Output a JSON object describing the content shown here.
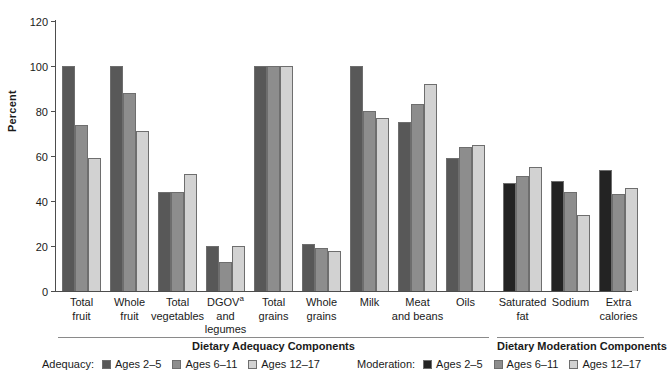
{
  "chart_data": {
    "type": "bar",
    "title": "",
    "xlabel": "",
    "ylabel": "Percent",
    "ylim": [
      0,
      120
    ],
    "ytick_values": [
      120,
      100,
      80,
      60,
      40,
      20,
      0
    ],
    "ytick_labels": [
      "120",
      "100",
      "80",
      "60",
      "40",
      "20",
      "0"
    ],
    "grid": false,
    "legend_position": "bottom",
    "categories": [
      "Total\nfruit",
      "Whole\nfruit",
      "Total\nvegetables",
      "DGOV\nand\nlegumes",
      "Total\ngrains",
      "Whole\ngrains",
      "Milk",
      "Meat\nand beans",
      "Oils",
      "Saturated\nfat",
      "Sodium",
      "Extra\ncalories"
    ],
    "series": [
      {
        "name": "Ages 2–5",
        "values": [
          100,
          100,
          44,
          20,
          100,
          21,
          100,
          75,
          59,
          48,
          49,
          54
        ]
      },
      {
        "name": "Ages 6–11",
        "values": [
          74,
          88,
          44,
          13,
          100,
          19,
          80,
          83,
          64,
          51,
          44,
          43
        ]
      },
      {
        "name": "Ages 12–17",
        "values": [
          59,
          71,
          52,
          20,
          100,
          18,
          77,
          92,
          65,
          55,
          34,
          46
        ]
      }
    ],
    "annotations": [
      "DGOVᵃ = dark green, orange vegetables"
    ],
    "sections": [
      {
        "name": "Dietary Adequacy Components",
        "categories": 9
      },
      {
        "name": "Dietary Moderation Components",
        "categories": 3
      }
    ]
  },
  "axis": {
    "y_title": "Percent",
    "y_ticks": [
      "120",
      "100",
      "80",
      "60",
      "40",
      "20",
      "0"
    ]
  },
  "categories": [
    {
      "line1": "Total",
      "line2": "fruit",
      "line3": ""
    },
    {
      "line1": "Whole",
      "line2": "fruit",
      "line3": ""
    },
    {
      "line1": "Total",
      "line2": "vegetables",
      "line3": ""
    },
    {
      "line1": "DGOV",
      "sup": "a",
      "line2": "and",
      "line3": "legumes"
    },
    {
      "line1": "Total",
      "line2": "grains",
      "line3": ""
    },
    {
      "line1": "Whole",
      "line2": "grains",
      "line3": ""
    },
    {
      "line1": "Milk",
      "line2": "",
      "line3": ""
    },
    {
      "line1": "Meat",
      "line2": "and beans",
      "line3": ""
    },
    {
      "line1": "Oils",
      "line2": "",
      "line3": ""
    },
    {
      "line1": "Saturated",
      "line2": "fat",
      "line3": ""
    },
    {
      "line1": "Sodium",
      "line2": "",
      "line3": ""
    },
    {
      "line1": "Extra",
      "line2": "calories",
      "line3": ""
    }
  ],
  "sections": {
    "adequacy_title": "Dietary Adequacy Components",
    "moderation_title": "Dietary Moderation Components"
  },
  "legend": {
    "adequacy_caption": "Adequacy:",
    "moderation_caption": "Moderation:",
    "entries": [
      "Ages 2–5",
      "Ages 6–11",
      "Ages 12–17"
    ]
  },
  "colors": {
    "adequacy_series1": "#585858",
    "adequacy_series2": "#8d8d8d",
    "adequacy_series3": "#d2d2d2",
    "moderation_series1": "#232323",
    "moderation_series2": "#8d8d8d",
    "moderation_series3": "#d2d2d2",
    "axis": "#4d4d4d"
  }
}
